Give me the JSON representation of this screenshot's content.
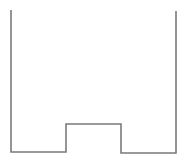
{
  "diagram": {
    "type": "step-profile",
    "stroke_color": "#7a7a7a",
    "stroke_width": 1.6,
    "background": "#ffffff",
    "points": [
      [
        11,
        10
      ],
      [
        11,
        152
      ],
      [
        66,
        152
      ],
      [
        66,
        124
      ],
      [
        121,
        124
      ],
      [
        121,
        153
      ],
      [
        176,
        153
      ],
      [
        176,
        11
      ]
    ],
    "segments": {
      "left_wall": {
        "x": 11,
        "y_top": 10,
        "y_bottom": 152
      },
      "left_floor": {
        "y": 152,
        "x_start": 11,
        "x_end": 66
      },
      "step": {
        "x_start": 66,
        "x_end": 121,
        "y_top": 124
      },
      "right_floor": {
        "y": 153,
        "x_start": 121,
        "x_end": 176
      },
      "right_wall": {
        "x": 176,
        "y_top": 11,
        "y_bottom": 153
      }
    }
  }
}
